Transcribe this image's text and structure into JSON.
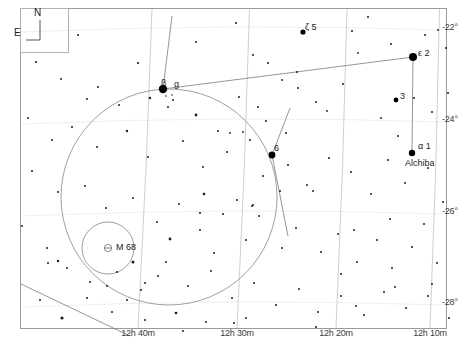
{
  "chart_data": {
    "type": "scatter",
    "xlabel": "Right Ascension",
    "ylabel": "Declination",
    "grid": true,
    "legend_position": "none",
    "ra_axis": {
      "ticks": [
        {
          "label": "12h 40m",
          "x": 138
        },
        {
          "label": "12h 30m",
          "x": 237
        },
        {
          "label": "12h 20m",
          "x": 336
        },
        {
          "label": "12h 10m",
          "x": 430
        }
      ]
    },
    "dec_axis": {
      "ticks": [
        {
          "label": "-22°",
          "y": 28
        },
        {
          "label": "-24°",
          "y": 120
        },
        {
          "label": "-26°",
          "y": 212
        },
        {
          "label": "-28°",
          "y": 303
        }
      ]
    },
    "compass": {
      "north_label": "N",
      "east_label": "E"
    },
    "named_stars": [
      {
        "name": "beta-corvi",
        "label": "β",
        "extra": "g",
        "x": 163,
        "y": 89,
        "mag_r": 4.2
      },
      {
        "name": "epsilon-corvi",
        "label": "ε 2",
        "x": 413,
        "y": 57,
        "mag_r": 4.0
      },
      {
        "name": "delta-corvi",
        "label": "δ",
        "extra": "6",
        "x": 272,
        "y": 155,
        "mag_r": 3.4
      },
      {
        "name": "alpha-corvi",
        "label": "α 1",
        "extra": "Alchiba",
        "x": 412,
        "y": 153,
        "mag_r": 3.2
      },
      {
        "name": "zeta-corvi",
        "label": "ζ 5",
        "x": 303,
        "y": 32,
        "mag_r": 2.6
      },
      {
        "name": "star-3",
        "label": "3",
        "x": 396,
        "y": 100,
        "mag_r": 2.4
      }
    ],
    "deep_sky_objects": [
      {
        "name": "m68-globular-cluster",
        "label": "M 68",
        "x": 108,
        "y": 248,
        "symbol": "globular-cluster"
      }
    ],
    "field_circle": {
      "cx": 169,
      "cy": 197,
      "r": 108
    },
    "finder_circle": {
      "cx": 108,
      "cy": 248,
      "r": 26
    },
    "background_stars": [
      [
        78,
        35,
        1.0
      ],
      [
        138,
        63,
        1.1
      ],
      [
        196,
        42,
        1.0
      ],
      [
        236,
        23,
        1.0
      ],
      [
        253,
        55,
        1.0
      ],
      [
        268,
        63,
        1.0
      ],
      [
        282,
        80,
        0.9
      ],
      [
        297,
        72,
        1.0
      ],
      [
        352,
        31,
        1.0
      ],
      [
        358,
        53,
        0.9
      ],
      [
        368,
        17,
        1.0
      ],
      [
        391,
        44,
        1.0
      ],
      [
        425,
        35,
        1.0
      ],
      [
        438,
        30,
        0.9
      ],
      [
        446,
        48,
        1.0
      ],
      [
        36,
        62,
        1.1
      ],
      [
        61,
        79,
        1.0
      ],
      [
        98,
        87,
        1.0
      ],
      [
        119,
        105,
        1.0
      ],
      [
        150,
        98,
        1.2
      ],
      [
        173,
        100,
        1.0
      ],
      [
        168,
        107,
        0.9
      ],
      [
        196,
        115,
        1.4
      ],
      [
        218,
        131,
        1.0
      ],
      [
        239,
        97,
        1.0
      ],
      [
        258,
        107,
        1.0
      ],
      [
        298,
        88,
        1.0
      ],
      [
        316,
        102,
        1.0
      ],
      [
        327,
        111,
        0.9
      ],
      [
        343,
        84,
        1.0
      ],
      [
        381,
        118,
        0.9
      ],
      [
        398,
        136,
        1.0
      ],
      [
        414,
        98,
        1.0
      ],
      [
        432,
        112,
        1.0
      ],
      [
        448,
        93,
        1.0
      ],
      [
        28,
        118,
        1.0
      ],
      [
        52,
        140,
        1.0
      ],
      [
        72,
        127,
        1.0
      ],
      [
        97,
        147,
        1.0
      ],
      [
        127,
        131,
        1.2
      ],
      [
        148,
        157,
        1.0
      ],
      [
        183,
        141,
        1.0
      ],
      [
        203,
        167,
        1.0
      ],
      [
        227,
        152,
        1.0
      ],
      [
        250,
        140,
        1.0
      ],
      [
        263,
        176,
        1.0
      ],
      [
        288,
        165,
        1.0
      ],
      [
        307,
        185,
        1.0
      ],
      [
        329,
        158,
        1.0
      ],
      [
        351,
        172,
        1.0
      ],
      [
        371,
        194,
        1.0
      ],
      [
        388,
        160,
        1.0
      ],
      [
        405,
        183,
        1.0
      ],
      [
        428,
        168,
        1.0
      ],
      [
        443,
        202,
        1.0
      ],
      [
        32,
        171,
        1.0
      ],
      [
        58,
        192,
        1.0
      ],
      [
        85,
        186,
        1.0
      ],
      [
        106,
        208,
        1.0
      ],
      [
        133,
        198,
        1.0
      ],
      [
        157,
        222,
        1.0
      ],
      [
        179,
        204,
        1.0
      ],
      [
        200,
        230,
        1.0
      ],
      [
        223,
        214,
        1.0
      ],
      [
        246,
        240,
        1.0
      ],
      [
        259,
        216,
        1.0
      ],
      [
        282,
        248,
        1.0
      ],
      [
        296,
        228,
        1.0
      ],
      [
        321,
        252,
        1.0
      ],
      [
        338,
        234,
        1.0
      ],
      [
        357,
        262,
        1.0
      ],
      [
        377,
        240,
        1.0
      ],
      [
        392,
        268,
        1.0
      ],
      [
        412,
        247,
        1.0
      ],
      [
        437,
        263,
        1.0
      ],
      [
        22,
        226,
        1.0
      ],
      [
        47,
        248,
        1.0
      ],
      [
        67,
        268,
        1.0
      ],
      [
        90,
        282,
        1.0
      ],
      [
        117,
        272,
        1.0
      ],
      [
        141,
        290,
        1.0
      ],
      [
        166,
        262,
        1.0
      ],
      [
        188,
        286,
        1.0
      ],
      [
        211,
        271,
        1.0
      ],
      [
        232,
        298,
        1.0
      ],
      [
        254,
        283,
        1.0
      ],
      [
        276,
        305,
        1.0
      ],
      [
        299,
        289,
        1.0
      ],
      [
        318,
        312,
        1.0
      ],
      [
        341,
        296,
        1.0
      ],
      [
        364,
        315,
        1.0
      ],
      [
        384,
        292,
        1.0
      ],
      [
        406,
        308,
        1.0
      ],
      [
        428,
        296,
        1.0
      ],
      [
        449,
        318,
        1.0
      ],
      [
        40,
        300,
        1.0
      ],
      [
        62,
        318,
        1.6
      ],
      [
        112,
        312,
        1.0
      ],
      [
        145,
        320,
        1.0
      ],
      [
        176,
        313,
        1.3
      ],
      [
        206,
        322,
        1.0
      ],
      [
        246,
        318,
        1.0
      ],
      [
        356,
        306,
        1.0
      ],
      [
        432,
        284,
        1.0
      ],
      [
        48,
        263,
        1.0
      ],
      [
        58,
        261,
        1.2
      ],
      [
        133,
        262,
        1.5
      ],
      [
        145,
        283,
        1.0
      ],
      [
        107,
        286,
        1.0
      ],
      [
        87,
        298,
        1.0
      ],
      [
        127,
        300,
        1.0
      ],
      [
        158,
        276,
        1.0
      ],
      [
        183,
        331,
        1.0
      ],
      [
        234,
        323,
        1.0
      ],
      [
        316,
        327,
        1.0
      ],
      [
        266,
        121,
        1.0
      ],
      [
        286,
        133,
        1.0
      ],
      [
        214,
        253,
        1.0
      ],
      [
        237,
        200,
        1.0
      ],
      [
        252,
        206,
        1.0
      ],
      [
        170,
        239,
        1.4
      ],
      [
        230,
        133,
        0.9
      ],
      [
        243,
        132,
        0.9
      ],
      [
        166,
        96,
        0.8
      ],
      [
        172,
        95,
        0.8
      ],
      [
        87,
        99,
        1.0
      ],
      [
        204,
        194,
        1.3
      ],
      [
        253,
        205,
        1.0
      ],
      [
        354,
        230,
        1.0
      ],
      [
        390,
        219,
        1.0
      ],
      [
        341,
        274,
        1.0
      ],
      [
        395,
        287,
        1.0
      ],
      [
        424,
        224,
        1.0
      ],
      [
        200,
        213,
        1.0
      ],
      [
        280,
        191,
        1.0
      ],
      [
        313,
        191,
        1.0
      ]
    ],
    "constellation_lines": [
      {
        "name": "beta-to-epsilon",
        "x1": 163,
        "y1": 89,
        "x2": 413,
        "y2": 57
      },
      {
        "name": "epsilon-to-alpha",
        "x1": 413,
        "y1": 57,
        "x2": 412,
        "y2": 153
      },
      {
        "name": "delta-upper",
        "x1": 272,
        "y1": 155,
        "x2": 290,
        "y2": 108
      },
      {
        "name": "delta-lower",
        "x1": 272,
        "y1": 155,
        "x2": 288,
        "y2": 236
      },
      {
        "name": "beta-upper",
        "x1": 163,
        "y1": 89,
        "x2": 172,
        "y2": 16
      },
      {
        "name": "lower-left-diagonal",
        "x1": 21,
        "y1": 284,
        "x2": 130,
        "y2": 336
      }
    ]
  }
}
